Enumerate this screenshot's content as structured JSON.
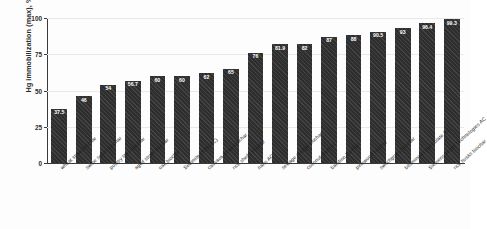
{
  "chart_data": {
    "type": "bar",
    "title": "",
    "xlabel": "",
    "ylabel": "Hg immobilization (max), %",
    "ylim": [
      0,
      100
    ],
    "yticks": [
      0,
      25,
      50,
      75,
      100
    ],
    "ytick_labels": [
      "0",
      "25",
      "50",
      "75",
      "100"
    ],
    "grid": true,
    "legend": "none",
    "bar_color": "#2e2e2e",
    "categories": [
      "wheat straw biochar",
      "swine solids biochar",
      "poultry litter biochar",
      "aged straw biochar",
      "oak biochar",
      "Sedimite (50% AC)",
      "cassava straw biochar",
      "rice shells biochar",
      "nano AC",
      "sewage sludge biochar",
      "coconut shell AC",
      "bamboo biochar",
      "pinewood biochar",
      "switchgrass biochar",
      "bituminous particulate AC",
      "Siemens Water Technologies AC",
      "rice husks biochar"
    ],
    "values": [
      37.5,
      46,
      54,
      56.7,
      60,
      60,
      62,
      65,
      76,
      81.9,
      82,
      87,
      88,
      90.5,
      93,
      96.4,
      99.3
    ],
    "value_labels": [
      "37.5",
      "46",
      "54",
      "56.7",
      "60",
      "60",
      "62",
      "65",
      "76",
      "81.9",
      "82",
      "87",
      "88",
      "90.5",
      "93",
      "96.4",
      "99.3"
    ]
  }
}
